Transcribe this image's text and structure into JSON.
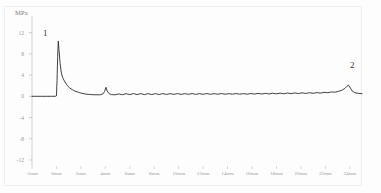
{
  "figure": {
    "unit_label": "MPa",
    "background_color": "#fdfdfd",
    "line_color": "#2b2b2b",
    "axis_color": "#bdbdbd"
  },
  "annotations": [
    {
      "name": "peak-1",
      "text": "1",
      "x_mm": 0.15,
      "y_value": 10.4
    },
    {
      "name": "peak-2",
      "text": "2",
      "x_mm": 23.9,
      "y_value": 2.1
    }
  ],
  "chart_data": {
    "type": "line",
    "title": "",
    "xlabel": "",
    "ylabel": "MPa",
    "grid": false,
    "legend": null,
    "xlim": [
      -2,
      25
    ],
    "ylim": [
      -12,
      14
    ],
    "x_tick_labels": [
      "-2mm",
      "0mm",
      "2mm",
      "4mm",
      "6mm",
      "8mm",
      "10mm",
      "12mm",
      "14mm",
      "16mm",
      "18mm",
      "20mm",
      "22mm",
      "24mm"
    ],
    "x_ticks": [
      -2,
      0,
      2,
      4,
      6,
      8,
      10,
      12,
      14,
      16,
      18,
      20,
      22,
      24
    ],
    "y_tick_labels": [
      "12",
      "8",
      "4",
      "0",
      "-4",
      "-8",
      "-12"
    ],
    "y_ticks": [
      12,
      8,
      4,
      0,
      -4,
      -8,
      -12
    ],
    "series": [
      {
        "name": "pressure",
        "x": [
          -2.0,
          -1.6,
          -1.2,
          -0.8,
          -0.4,
          -0.1,
          0.0,
          0.05,
          0.1,
          0.15,
          0.2,
          0.3,
          0.4,
          0.5,
          0.6,
          0.75,
          0.9,
          1.1,
          1.3,
          1.5,
          1.8,
          2.1,
          2.4,
          2.7,
          3.0,
          3.3,
          3.6,
          3.8,
          3.95,
          4.05,
          4.15,
          4.3,
          4.5,
          4.8,
          5.1,
          5.4,
          5.7,
          6.0,
          6.3,
          6.6,
          6.9,
          7.2,
          7.5,
          7.8,
          8.1,
          8.4,
          8.7,
          9.0,
          9.3,
          9.6,
          9.9,
          10.2,
          10.5,
          10.8,
          11.1,
          11.4,
          11.7,
          12.0,
          12.3,
          12.6,
          12.9,
          13.2,
          13.5,
          13.8,
          14.1,
          14.4,
          14.7,
          15.0,
          15.3,
          15.6,
          15.9,
          16.2,
          16.5,
          16.8,
          17.1,
          17.4,
          17.7,
          18.0,
          18.3,
          18.6,
          18.9,
          19.2,
          19.5,
          19.8,
          20.1,
          20.4,
          20.7,
          21.0,
          21.3,
          21.6,
          21.9,
          22.2,
          22.5,
          22.8,
          23.1,
          23.4,
          23.6,
          23.75,
          23.9,
          24.05,
          24.2,
          24.4,
          24.7,
          25.0
        ],
        "y": [
          0.0,
          0.0,
          0.0,
          0.0,
          0.0,
          0.0,
          0.1,
          3.0,
          7.5,
          10.4,
          9.0,
          6.2,
          4.4,
          3.6,
          3.1,
          2.5,
          2.0,
          1.55,
          1.25,
          1.0,
          0.75,
          0.55,
          0.42,
          0.35,
          0.3,
          0.28,
          0.3,
          0.45,
          0.95,
          1.7,
          1.0,
          0.5,
          0.32,
          0.28,
          0.45,
          0.3,
          0.5,
          0.32,
          0.52,
          0.33,
          0.5,
          0.32,
          0.5,
          0.33,
          0.5,
          0.34,
          0.52,
          0.35,
          0.5,
          0.36,
          0.52,
          0.36,
          0.5,
          0.37,
          0.52,
          0.37,
          0.5,
          0.38,
          0.52,
          0.38,
          0.5,
          0.39,
          0.52,
          0.39,
          0.5,
          0.4,
          0.52,
          0.4,
          0.5,
          0.41,
          0.52,
          0.42,
          0.55,
          0.43,
          0.56,
          0.44,
          0.58,
          0.46,
          0.6,
          0.48,
          0.62,
          0.5,
          0.64,
          0.52,
          0.66,
          0.54,
          0.68,
          0.56,
          0.7,
          0.6,
          0.75,
          0.68,
          0.82,
          0.78,
          0.95,
          1.2,
          1.5,
          1.85,
          2.1,
          1.55,
          1.0,
          0.7,
          0.55,
          0.5
        ]
      }
    ]
  }
}
